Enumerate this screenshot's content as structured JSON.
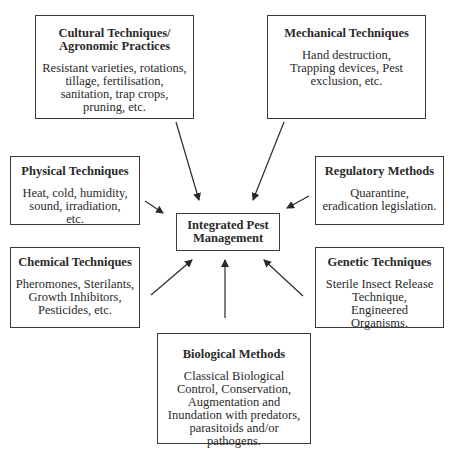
{
  "center": {
    "title": "Integrated Pest Management"
  },
  "nodes": {
    "cultural": {
      "title": "Cultural Techniques/ Agronomic Practices",
      "description": "Resistant varieties, rotations, tillage, fertilisation, sanitation, trap crops, pruning, etc."
    },
    "mechanical": {
      "title": "Mechanical Techniques",
      "description": "Hand destruction, Trapping devices, Pest exclusion, etc."
    },
    "physical": {
      "title": "Physical Techniques",
      "description": "Heat, cold, humidity, sound, irradiation, etc."
    },
    "regulatory": {
      "title": "Regulatory Methods",
      "description": "Quarantine, eradication legislation."
    },
    "chemical": {
      "title": "Chemical Techniques",
      "description": "Pheromones, Sterilants, Growth Inhibitors, Pesticides, etc."
    },
    "genetic": {
      "title": "Genetic Techniques",
      "description": "Sterile Insect Release Technique, Engineered Organisms."
    },
    "biological": {
      "title": "Biological Methods",
      "description": "Classical Biological Control, Conservation, Augmentation and Inundation with predators, parasitoids and/or pathogens."
    }
  },
  "edges": [
    {
      "from": "cultural",
      "to": "center"
    },
    {
      "from": "mechanical",
      "to": "center"
    },
    {
      "from": "physical",
      "to": "center"
    },
    {
      "from": "regulatory",
      "to": "center"
    },
    {
      "from": "chemical",
      "to": "center"
    },
    {
      "from": "genetic",
      "to": "center"
    },
    {
      "from": "biological",
      "to": "center"
    }
  ]
}
